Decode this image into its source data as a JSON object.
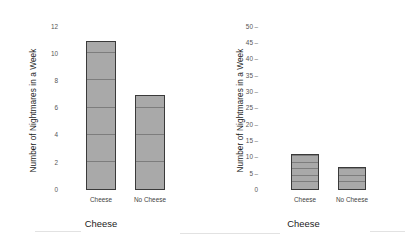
{
  "figure": {
    "panels": [
      {
        "id": "left",
        "ylabel": "Number of Nightmares in a Week",
        "xlabel": "Cheese",
        "yticks": [
          "12",
          "10",
          "8",
          "6",
          "4",
          "2",
          "0"
        ],
        "categories": [
          "Cheese",
          "No Cheese"
        ],
        "values": [
          11,
          7
        ]
      },
      {
        "id": "right",
        "ylabel": "Number of Nightmares in a Week",
        "xlabel": "Cheese",
        "yticks": [
          "50",
          "45",
          "40",
          "35",
          "30",
          "25",
          "20",
          "15",
          "10",
          "5",
          "0"
        ],
        "categories": [
          "Cheese",
          "No Cheese"
        ],
        "values": [
          11,
          7
        ]
      }
    ]
  },
  "chart_data": [
    {
      "type": "bar",
      "title": "",
      "subtitle": "",
      "categories": [
        "Cheese",
        "No Cheese"
      ],
      "values": [
        11,
        7
      ],
      "xlabel": "Cheese",
      "ylabel": "Number of Nightmares in a Week",
      "ylim": [
        0,
        12
      ],
      "ytick_step": 2,
      "yticks": [
        0,
        2,
        4,
        6,
        8,
        10,
        12
      ],
      "grid": false,
      "legend": "none",
      "bar_fill": "#a9a9a9",
      "bar_border": "#3a3a3a",
      "notes": "Left panel: y-axis truncated at 12 making the difference look large; bars show faint internal stacking lines roughly every 2 units."
    },
    {
      "type": "bar",
      "title": "",
      "subtitle": "",
      "categories": [
        "Cheese",
        "No Cheese"
      ],
      "values": [
        11,
        7
      ],
      "xlabel": "Cheese",
      "ylabel": "Number of Nightmares in a Week",
      "ylim": [
        0,
        50
      ],
      "ytick_step": 5,
      "yticks": [
        0,
        5,
        10,
        15,
        20,
        25,
        30,
        35,
        40,
        45,
        50
      ],
      "grid": false,
      "legend": "none",
      "bar_fill": "#a9a9a9",
      "bar_border": "#3a3a3a",
      "notes": "Right panel: identical data on a 0-50 axis, making the same difference look small."
    }
  ],
  "colors": {
    "bar_fill": "#a9a9a9",
    "bar_border": "#3a3a3a",
    "segment_line": "#7d7d7d",
    "tick_text": "#555555",
    "title_text": "#1a1a1a",
    "background": "#ffffff"
  }
}
